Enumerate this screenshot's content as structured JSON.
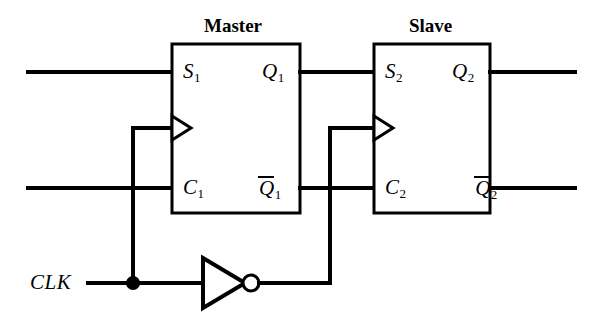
{
  "figure": {
    "type": "logic-circuit-schematic",
    "background_color": "#ffffff",
    "line_color": "#000000"
  },
  "blocks": [
    {
      "id": "master",
      "title": "Master",
      "title_x": 236,
      "title_y": 30,
      "x": 172,
      "y": 44,
      "width": 128,
      "height": 169,
      "clock_marker": "edge-triangle",
      "pins": [
        {
          "name": "S1",
          "base": "S",
          "sub": "1",
          "overbar": false,
          "side": "left",
          "x": 182,
          "y": 72
        },
        {
          "name": "C1",
          "base": "C",
          "sub": "1",
          "overbar": false,
          "side": "left",
          "x": 182,
          "y": 188
        },
        {
          "name": "Q1",
          "base": "Q",
          "sub": "1",
          "overbar": false,
          "side": "right",
          "x": 262,
          "y": 72
        },
        {
          "name": "Q1bar",
          "base": "Q",
          "sub": "1",
          "overbar": true,
          "side": "right",
          "x": 259,
          "y": 188
        }
      ]
    },
    {
      "id": "slave",
      "title": "Slave",
      "title_x": 432,
      "title_y": 30,
      "x": 374,
      "y": 44,
      "width": 116,
      "height": 169,
      "clock_marker": "edge-triangle",
      "pins": [
        {
          "name": "S2",
          "base": "S",
          "sub": "2",
          "overbar": false,
          "side": "left",
          "x": 384,
          "y": 72
        },
        {
          "name": "C2",
          "base": "C",
          "sub": "2",
          "overbar": false,
          "side": "left",
          "x": 384,
          "y": 188
        },
        {
          "name": "Q2",
          "base": "Q",
          "sub": "2",
          "overbar": false,
          "side": "right",
          "x": 452,
          "y": 72
        },
        {
          "name": "Q2bar",
          "base": "Q",
          "sub": "2",
          "overbar": true,
          "side": "right",
          "x": 449,
          "y": 188
        }
      ]
    }
  ],
  "signals": {
    "clk_label": "CLK",
    "clk_label_x": 30,
    "clk_label_y": 272,
    "clk_rail_y": 283,
    "top_row_y": 72,
    "bottom_row_y": 188,
    "clock_input_y": 128,
    "left_wire_start_x": 28,
    "right_wire_end_x": 575,
    "clk_branch_x": 133,
    "inverter_out_x": 330
  },
  "inverter": {
    "name": "clock-inverter",
    "tip_x": 245,
    "back_x": 203,
    "top_y": 258,
    "bottom_y": 308,
    "bubble_cx": 251,
    "bubble_r": 8,
    "input_x": 133,
    "output_x": 330
  },
  "junctions": [
    {
      "name": "clk-tap",
      "x": 133,
      "y": 283,
      "r": 7
    }
  ],
  "crossings": [
    {
      "name": "clk-branch-over-c1-row",
      "x": 133,
      "y": 188
    },
    {
      "name": "inverter-out-over-qbar1-row",
      "x": 330,
      "y": 188
    }
  ],
  "nets": [
    {
      "name": "s1-input",
      "from": "left edge",
      "to": "Master S1"
    },
    {
      "name": "c1-input",
      "from": "left edge",
      "to": "Master C1"
    },
    {
      "name": "q1-to-s2",
      "from": "Master Q1",
      "to": "Slave S2"
    },
    {
      "name": "q1bar-to-c2",
      "from": "Master Q1bar",
      "to": "Slave C2"
    },
    {
      "name": "q2-output",
      "from": "Slave Q2",
      "to": "right edge"
    },
    {
      "name": "q2bar-output",
      "from": "Slave Q2bar",
      "to": "right edge"
    },
    {
      "name": "clk-to-master",
      "from": "CLK",
      "to": "Master clock input"
    },
    {
      "name": "clk-to-inverter",
      "from": "CLK",
      "to": "inverter input"
    },
    {
      "name": "inverter-to-slave",
      "from": "inverter output",
      "to": "Slave clock input"
    }
  ]
}
